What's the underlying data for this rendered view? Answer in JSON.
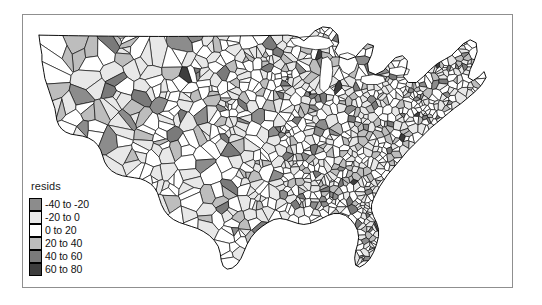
{
  "figure": {
    "background_color": "#ffffff",
    "frame_color": "#8f8f8f",
    "outline_color": "#000000"
  },
  "legend": {
    "title": "resids",
    "entries": [
      {
        "label": "-40 to -20",
        "color": "#8c8c8c"
      },
      {
        "label": "-20 to 0",
        "color": "#e8e8e8"
      },
      {
        "label": "0 to 20",
        "color": "#ffffff"
      },
      {
        "label": "20 to 40",
        "color": "#bdbdbd"
      },
      {
        "label": "40 to 60",
        "color": "#7a7a7a"
      },
      {
        "label": "60 to 80",
        "color": "#3d3d3d"
      }
    ]
  },
  "chart_data": {
    "type": "map",
    "subtype": "choropleth",
    "title": "",
    "region": "United States counties (conterminous)",
    "variable": "resids",
    "legend_title": "resids",
    "classification": "equal-interval bins of width 20",
    "bins": [
      {
        "label": "-40 to -20",
        "min": -40,
        "max": -20,
        "color": "#8c8c8c"
      },
      {
        "label": "-20 to 0",
        "min": -20,
        "max": 0,
        "color": "#e8e8e8"
      },
      {
        "label": "0 to 20",
        "min": 0,
        "max": 20,
        "color": "#ffffff"
      },
      {
        "label": "20 to 40",
        "min": 20,
        "max": 40,
        "color": "#bdbdbd"
      },
      {
        "label": "40 to 60",
        "min": 40,
        "max": 60,
        "color": "#7a7a7a"
      },
      {
        "label": "60 to 80",
        "min": 60,
        "max": 80,
        "color": "#3d3d3d"
      }
    ],
    "value_range": [
      -40,
      80
    ],
    "grid": false,
    "axes_visible": false,
    "legend_position": "lower-left inside plot frame",
    "polygon_outline_color": "#000000"
  }
}
